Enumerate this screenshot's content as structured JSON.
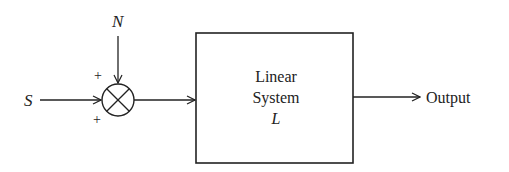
{
  "diagram": {
    "type": "block-diagram",
    "inputs": {
      "signal_label": "S",
      "noise_label": "N"
    },
    "summing_junction": {
      "symbol": "multiply-cross-circle",
      "signs": {
        "top_input": "+",
        "left_input": "+"
      }
    },
    "block": {
      "line1": "Linear",
      "line2": "System",
      "line3": "L"
    },
    "output_label": "Output",
    "colors": {
      "stroke": "#222222",
      "background": "#ffffff"
    }
  }
}
